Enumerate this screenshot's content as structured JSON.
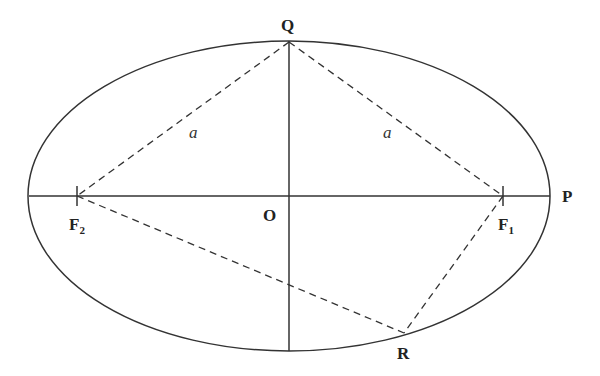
{
  "diagram": {
    "type": "ellipse-geometry",
    "ellipse": {
      "cx": 289,
      "cy": 196,
      "rx": 261,
      "ry": 155
    },
    "points": {
      "Q": {
        "label": "Q",
        "x": 289,
        "y": 42
      },
      "O": {
        "label": "O",
        "x": 289,
        "y": 196
      },
      "P": {
        "label": "P",
        "x": 550,
        "y": 196
      },
      "F1": {
        "label": "F",
        "sub": "1",
        "x": 503,
        "y": 196
      },
      "F2": {
        "label": "F",
        "sub": "2",
        "x": 77,
        "y": 196
      },
      "R": {
        "label": "R",
        "x": 404,
        "y": 333
      }
    },
    "segment_labels": {
      "left_a": "a",
      "right_a": "a"
    },
    "colors": {
      "line": "#333333",
      "text": "#222222",
      "background": "#ffffff"
    }
  }
}
